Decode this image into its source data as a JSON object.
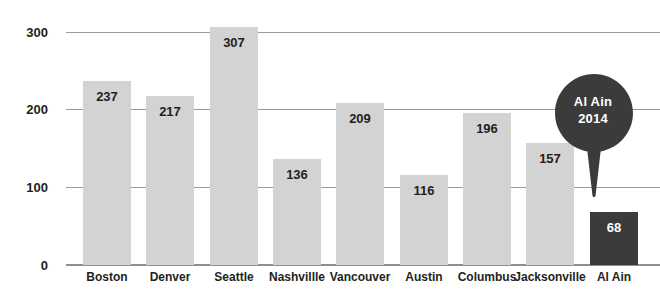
{
  "chart_data": {
    "type": "bar",
    "title": "",
    "subtitle": "",
    "xlabel": "",
    "ylabel": "",
    "ylim": [
      0,
      320
    ],
    "yticks": [
      0,
      100,
      200,
      300
    ],
    "ytick_labels": [
      "0",
      "100",
      "200",
      "300"
    ],
    "grid": true,
    "legend": null,
    "categories": [
      "Boston",
      "Denver",
      "Seattle",
      "Nashvillle",
      "Vancouver",
      "Austin",
      "Columbus",
      "Jacksonville",
      "Al Ain"
    ],
    "values": [
      237,
      217,
      307,
      136,
      209,
      116,
      196,
      157,
      68
    ],
    "value_labels": [
      "237",
      "217",
      "307",
      "136",
      "209",
      "116",
      "196",
      "157",
      "68"
    ],
    "highlight_index": 8,
    "colors": {
      "bar": "#d3d3d3",
      "bar_highlight": "#3b3b3b",
      "value_label": "#231f20",
      "value_label_highlight": "#ffffff",
      "axis_text": "#231f20",
      "gridline": "#9a9a9a",
      "baseline": "#8f8f8f",
      "callout_fill": "#3b3b3b",
      "callout_text": "#ffffff",
      "background": "#ffffff"
    },
    "annotations": [
      {
        "name": "al-ain-callout",
        "shape": "map-pin",
        "line1": "Al Ain",
        "line2": "2014",
        "points_to_category": "Al Ain"
      }
    ]
  }
}
